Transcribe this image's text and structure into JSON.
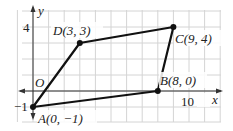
{
  "figure": {
    "type": "coordinate-plane-quadrilateral",
    "axes": {
      "x_label": "x",
      "y_label": "y",
      "origin_label": "O",
      "x_tick_label": "10",
      "y_tick_label": "4",
      "y_neg_tick_label": "−1"
    },
    "points": [
      {
        "name": "A",
        "x": 0,
        "y": -1,
        "label": "A(0, −1)"
      },
      {
        "name": "B",
        "x": 8,
        "y": 0,
        "label": "B(8, 0)"
      },
      {
        "name": "C",
        "x": 9,
        "y": 4,
        "label": "C(9, 4)"
      },
      {
        "name": "D",
        "x": 3,
        "y": 3,
        "label": "D(3, 3)"
      }
    ],
    "polygon_order": [
      "A",
      "B",
      "C",
      "D"
    ],
    "colors": {
      "grid": "#d4d4d4",
      "axis": "#333333",
      "edge": "#111111"
    }
  }
}
